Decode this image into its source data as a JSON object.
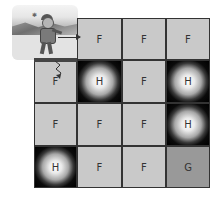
{
  "diagram": {
    "type": "gridworld",
    "title": "",
    "rows": 4,
    "cols": 4,
    "cells": [
      [
        {
          "label": "",
          "kind": "start-image"
        },
        {
          "label": "F",
          "kind": "frozen"
        },
        {
          "label": "F",
          "kind": "frozen"
        },
        {
          "label": "F",
          "kind": "frozen"
        }
      ],
      [
        {
          "label": "F",
          "kind": "frozen"
        },
        {
          "label": "H",
          "kind": "hole"
        },
        {
          "label": "F",
          "kind": "frozen"
        },
        {
          "label": "H",
          "kind": "hole"
        }
      ],
      [
        {
          "label": "F",
          "kind": "frozen"
        },
        {
          "label": "F",
          "kind": "frozen"
        },
        {
          "label": "F",
          "kind": "frozen"
        },
        {
          "label": "H",
          "kind": "hole"
        }
      ],
      [
        {
          "label": "H",
          "kind": "hole"
        },
        {
          "label": "F",
          "kind": "frozen"
        },
        {
          "label": "F",
          "kind": "frozen"
        },
        {
          "label": "G",
          "kind": "goal"
        }
      ]
    ],
    "legend_icons": {
      "start": "skater-on-ice-icon",
      "move_right": "arrow-right-icon",
      "move_down": "squiggle-arrow-down-icon"
    },
    "colors": {
      "frozen": "#c9c9c9",
      "hole_outer": "#000000",
      "hole_center": "#ffffff",
      "goal": "#999999",
      "border": "#333333"
    }
  }
}
